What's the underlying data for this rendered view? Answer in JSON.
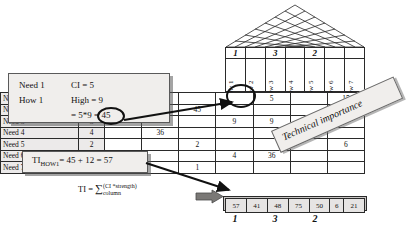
{
  "diagram": {
    "roof": {
      "name": "correlation-roof",
      "rows": 4
    },
    "columns": {
      "rank_row": [
        "1",
        "",
        "3",
        "",
        "2",
        "",
        ""
      ],
      "labels": [
        "How 1",
        "How 2",
        "How 3",
        "How 4",
        "How 5",
        "How 6",
        "How 7"
      ]
    },
    "matrix": {
      "ci_header": "CI",
      "rows": [
        {
          "need": "Need 1",
          "ci": "CI",
          "values": [
            "45",
            "5",
            "",
            "",
            "5",
            "",
            "15"
          ]
        },
        {
          "need": "Need 2",
          "ci": "5",
          "values": [
            "",
            "",
            "45",
            "",
            "",
            "",
            ""
          ]
        },
        {
          "need": "Need 3",
          "ci": "3",
          "values": [
            "",
            "",
            "",
            "9",
            "9",
            "3",
            ""
          ]
        },
        {
          "need": "Need 4",
          "ci": "4",
          "values": [
            "",
            "36",
            "",
            "",
            "",
            "",
            ""
          ]
        },
        {
          "need": "Need 5",
          "ci": "2",
          "values": [
            "",
            "",
            "2",
            "",
            "",
            "",
            "6"
          ]
        },
        {
          "need": "Need 6",
          "ci": "4",
          "values": [
            "12",
            "",
            "",
            "4",
            "36",
            "",
            ""
          ]
        },
        {
          "need": "Need 7",
          "ci": "1",
          "values": [
            "",
            "",
            "1",
            "",
            "",
            "",
            ""
          ]
        }
      ]
    },
    "technical_importance": {
      "values": [
        "57",
        "41",
        "48",
        "75",
        "50",
        "6",
        "21"
      ],
      "ranks": [
        "1",
        "",
        "3",
        "",
        "2",
        "",
        ""
      ],
      "banner_label": "Technical importance"
    },
    "callout_cell": {
      "line1_left": "Need 1",
      "line1_right": "CI = 5",
      "line2_left": "How 1",
      "line2_right": "High = 9",
      "line3": "= 5*9 = 45",
      "circled_value": "45"
    },
    "callout_column": {
      "label_prefix": "TI",
      "label_sub": "HOW1",
      "equation": "= 45 + 12 = 57"
    },
    "formula": {
      "lhs": "TI =",
      "sum_symbol": "∑",
      "sum_sup": "(CI *strength)",
      "sum_sub": "column"
    },
    "colors": {
      "line": "#2a2a2a",
      "panel_fill": "#f0eeec",
      "shaded_cell": "#eceaea",
      "arrow_grey": "#7a7876"
    }
  }
}
